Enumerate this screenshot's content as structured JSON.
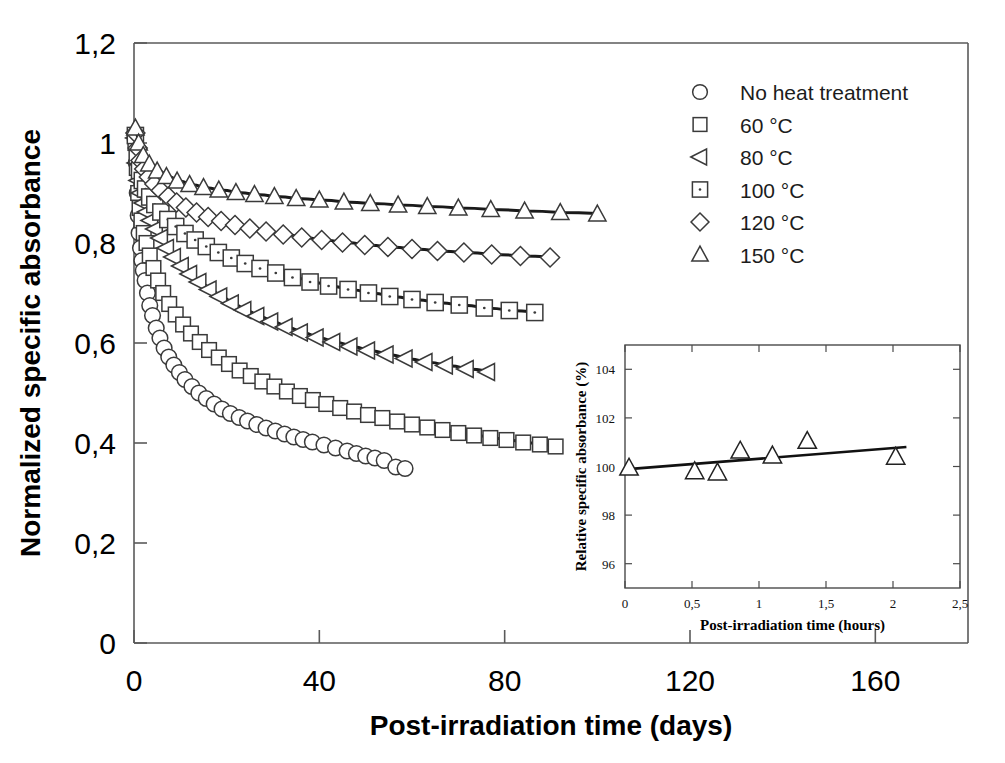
{
  "figure": {
    "background": "#ffffff",
    "ink_color": "#1a1a1a"
  },
  "chart_data": [
    {
      "id": "main",
      "type": "scatter",
      "title": "",
      "xlabel": "Post-irradiation time (days)",
      "ylabel": "Normalized specific absorbance",
      "xlim": [
        0,
        180
      ],
      "ylim": [
        0,
        1.2
      ],
      "xticks": [
        0,
        40,
        80,
        120,
        160
      ],
      "xtick_labels": [
        "0",
        "40",
        "80",
        "120",
        "160"
      ],
      "yticks": [
        0,
        0.2,
        0.4,
        0.6,
        0.8,
        1,
        1.2
      ],
      "ytick_labels": [
        "0",
        "0,2",
        "0,4",
        "0,6",
        "0,8",
        "1",
        "1,2"
      ],
      "grid": false,
      "legend_position": "top-right",
      "series": [
        {
          "name": "No heat treatment",
          "marker": "circle",
          "points": [
            [
              0.3,
              1.005
            ],
            [
              0.5,
              0.96
            ],
            [
              0.7,
              0.9
            ],
            [
              0.9,
              0.855
            ],
            [
              1.1,
              0.82
            ],
            [
              1.4,
              0.79
            ],
            [
              1.7,
              0.765
            ],
            [
              2.0,
              0.745
            ],
            [
              2.4,
              0.725
            ],
            [
              2.9,
              0.7
            ],
            [
              3.4,
              0.675
            ],
            [
              4.0,
              0.655
            ],
            [
              4.8,
              0.63
            ],
            [
              5.6,
              0.61
            ],
            [
              6.5,
              0.59
            ],
            [
              7.5,
              0.572
            ],
            [
              8.6,
              0.556
            ],
            [
              9.8,
              0.541
            ],
            [
              11.0,
              0.527
            ],
            [
              12.5,
              0.513
            ],
            [
              14.0,
              0.5
            ],
            [
              15.6,
              0.489
            ],
            [
              17.3,
              0.478
            ],
            [
              19.0,
              0.468
            ],
            [
              20.8,
              0.459
            ],
            [
              22.7,
              0.451
            ],
            [
              24.5,
              0.444
            ],
            [
              26.5,
              0.437
            ],
            [
              28.5,
              0.43
            ],
            [
              30.5,
              0.424
            ],
            [
              32.5,
              0.418
            ],
            [
              34.5,
              0.412
            ],
            [
              36.5,
              0.407
            ],
            [
              38.5,
              0.402
            ],
            [
              41.0,
              0.396
            ],
            [
              43.5,
              0.39
            ],
            [
              46.0,
              0.384
            ],
            [
              48.0,
              0.379
            ],
            [
              50.0,
              0.374
            ],
            [
              52.0,
              0.37
            ],
            [
              54.0,
              0.365
            ],
            [
              56.5,
              0.352
            ],
            [
              58.5,
              0.349
            ]
          ],
          "fit_from": 0.3,
          "fit_to": 57.0
        },
        {
          "name": "60 °C",
          "marker": "square",
          "points": [
            [
              0.3,
              1.0
            ],
            [
              0.6,
              0.95
            ],
            [
              0.9,
              0.9
            ],
            [
              1.2,
              0.87
            ],
            [
              1.6,
              0.845
            ],
            [
              2.1,
              0.82
            ],
            [
              2.7,
              0.8
            ],
            [
              3.4,
              0.775
            ],
            [
              4.2,
              0.75
            ],
            [
              5.2,
              0.725
            ],
            [
              6.3,
              0.7
            ],
            [
              7.6,
              0.678
            ],
            [
              9.0,
              0.657
            ],
            [
              10.6,
              0.637
            ],
            [
              12.3,
              0.619
            ],
            [
              14.2,
              0.602
            ],
            [
              16.2,
              0.586
            ],
            [
              18.3,
              0.571
            ],
            [
              20.5,
              0.558
            ],
            [
              22.8,
              0.545
            ],
            [
              25.2,
              0.534
            ],
            [
              27.7,
              0.523
            ],
            [
              30.3,
              0.513
            ],
            [
              33.0,
              0.503
            ],
            [
              35.8,
              0.494
            ],
            [
              38.6,
              0.486
            ],
            [
              41.5,
              0.478
            ],
            [
              44.5,
              0.47
            ],
            [
              47.5,
              0.463
            ],
            [
              50.5,
              0.456
            ],
            [
              53.6,
              0.45
            ],
            [
              56.8,
              0.443
            ],
            [
              60.0,
              0.437
            ],
            [
              63.3,
              0.431
            ],
            [
              66.6,
              0.426
            ],
            [
              70.0,
              0.42
            ],
            [
              73.4,
              0.415
            ],
            [
              76.9,
              0.41
            ],
            [
              80.4,
              0.406
            ],
            [
              84.0,
              0.401
            ],
            [
              87.6,
              0.397
            ],
            [
              91.0,
              0.393
            ]
          ],
          "fit_from": 0.3,
          "fit_to": 91.0
        },
        {
          "name": "80 °C",
          "marker": "left-triangle",
          "points": [
            [
              0.3,
              1.01
            ],
            [
              0.6,
              0.96
            ],
            [
              1.0,
              0.925
            ],
            [
              1.5,
              0.9
            ],
            [
              2.1,
              0.88
            ],
            [
              2.8,
              0.862
            ],
            [
              3.6,
              0.845
            ],
            [
              4.6,
              0.828
            ],
            [
              5.7,
              0.81
            ],
            [
              7.0,
              0.79
            ],
            [
              8.5,
              0.772
            ],
            [
              10.2,
              0.754
            ],
            [
              12.0,
              0.738
            ],
            [
              14.0,
              0.722
            ],
            [
              16.2,
              0.707
            ],
            [
              18.5,
              0.693
            ],
            [
              21.0,
              0.679
            ],
            [
              23.7,
              0.666
            ],
            [
              26.5,
              0.654
            ],
            [
              29.5,
              0.643
            ],
            [
              32.6,
              0.632
            ],
            [
              35.9,
              0.621
            ],
            [
              39.3,
              0.611
            ],
            [
              42.9,
              0.602
            ],
            [
              46.6,
              0.593
            ],
            [
              50.4,
              0.585
            ],
            [
              54.4,
              0.577
            ],
            [
              58.5,
              0.569
            ],
            [
              62.8,
              0.562
            ],
            [
              67.2,
              0.555
            ],
            [
              71.7,
              0.548
            ],
            [
              76.3,
              0.542
            ]
          ],
          "fit_from": 0.3,
          "fit_to": 80.0
        },
        {
          "name": "100 °C",
          "marker": "dotted-square",
          "points": [
            [
              0.3,
              1.015
            ],
            [
              0.7,
              0.975
            ],
            [
              1.2,
              0.945
            ],
            [
              1.8,
              0.925
            ],
            [
              2.5,
              0.908
            ],
            [
              3.4,
              0.892
            ],
            [
              4.5,
              0.877
            ],
            [
              5.8,
              0.862
            ],
            [
              7.3,
              0.847
            ],
            [
              9.0,
              0.833
            ],
            [
              11.0,
              0.819
            ],
            [
              13.2,
              0.806
            ],
            [
              15.6,
              0.793
            ],
            [
              18.2,
              0.781
            ],
            [
              21.0,
              0.77
            ],
            [
              24.0,
              0.759
            ],
            [
              27.2,
              0.749
            ],
            [
              30.6,
              0.74
            ],
            [
              34.2,
              0.731
            ],
            [
              38.0,
              0.722
            ],
            [
              42.0,
              0.714
            ],
            [
              46.2,
              0.707
            ],
            [
              50.6,
              0.7
            ],
            [
              55.2,
              0.693
            ],
            [
              60.0,
              0.687
            ],
            [
              65.0,
              0.681
            ],
            [
              70.2,
              0.676
            ],
            [
              75.6,
              0.67
            ],
            [
              81.0,
              0.665
            ],
            [
              86.5,
              0.661
            ]
          ],
          "fit_from": 0.3,
          "fit_to": 88.0
        },
        {
          "name": "120 °C",
          "marker": "diamond",
          "points": [
            [
              0.3,
              1.02
            ],
            [
              0.8,
              0.99
            ],
            [
              1.4,
              0.965
            ],
            [
              2.2,
              0.948
            ],
            [
              3.2,
              0.932
            ],
            [
              4.4,
              0.918
            ],
            [
              5.8,
              0.905
            ],
            [
              7.4,
              0.893
            ],
            [
              9.2,
              0.881
            ],
            [
              11.2,
              0.871
            ],
            [
              13.5,
              0.861
            ],
            [
              16.0,
              0.852
            ],
            [
              18.8,
              0.844
            ],
            [
              21.8,
              0.836
            ],
            [
              25.0,
              0.829
            ],
            [
              28.5,
              0.823
            ],
            [
              32.2,
              0.817
            ],
            [
              36.2,
              0.811
            ],
            [
              40.5,
              0.806
            ],
            [
              45.0,
              0.801
            ],
            [
              49.8,
              0.796
            ],
            [
              54.8,
              0.792
            ],
            [
              60.0,
              0.788
            ],
            [
              65.5,
              0.784
            ],
            [
              71.2,
              0.781
            ],
            [
              77.2,
              0.777
            ],
            [
              83.4,
              0.774
            ],
            [
              89.8,
              0.771
            ]
          ],
          "fit_from": 0.3,
          "fit_to": 92.0
        },
        {
          "name": "150 °C",
          "marker": "triangle",
          "points": [
            [
              0.3,
              1.03
            ],
            [
              1.0,
              1.0
            ],
            [
              2.0,
              0.975
            ],
            [
              3.3,
              0.958
            ],
            [
              5.0,
              0.944
            ],
            [
              7.0,
              0.933
            ],
            [
              9.3,
              0.924
            ],
            [
              12.0,
              0.917
            ],
            [
              15.0,
              0.911
            ],
            [
              18.3,
              0.906
            ],
            [
              22.0,
              0.901
            ],
            [
              26.0,
              0.897
            ],
            [
              30.3,
              0.893
            ],
            [
              35.0,
              0.889
            ],
            [
              40.0,
              0.886
            ],
            [
              45.3,
              0.882
            ],
            [
              51.0,
              0.879
            ],
            [
              57.0,
              0.876
            ],
            [
              63.3,
              0.873
            ],
            [
              70.0,
              0.87
            ],
            [
              77.0,
              0.867
            ],
            [
              84.3,
              0.864
            ],
            [
              92.0,
              0.861
            ],
            [
              100.0,
              0.858
            ]
          ],
          "fit_from": 0.3,
          "fit_to": 102.0
        }
      ]
    },
    {
      "id": "inset",
      "type": "scatter",
      "title": "",
      "xlabel": "Post-irradiation time (hours)",
      "ylabel": "Relative specific absorbance (%)",
      "xlim": [
        0,
        2.5
      ],
      "ylim": [
        95,
        105
      ],
      "xticks": [
        0,
        0.5,
        1,
        1.5,
        2,
        2.5
      ],
      "xtick_labels": [
        "0",
        "0,5",
        "1",
        "1,5",
        "2",
        "2,5"
      ],
      "yticks": [
        96,
        98,
        100,
        102,
        104
      ],
      "ytick_labels": [
        "96",
        "98",
        "100",
        "102",
        "104"
      ],
      "grid": false,
      "marker": "triangle",
      "points": [
        [
          0.03,
          99.95
        ],
        [
          0.52,
          99.8
        ],
        [
          0.69,
          99.75
        ],
        [
          0.86,
          100.65
        ],
        [
          1.1,
          100.45
        ],
        [
          1.36,
          101.05
        ],
        [
          2.02,
          100.4
        ]
      ],
      "trendline": {
        "x": [
          0.0,
          2.1
        ],
        "y": [
          99.88,
          100.8
        ]
      }
    }
  ],
  "legend": {
    "items": [
      {
        "marker": "circle",
        "label": "No heat treatment"
      },
      {
        "marker": "square",
        "label": "60 °C"
      },
      {
        "marker": "left-triangle",
        "label": "80 °C"
      },
      {
        "marker": "dotted-square",
        "label": "100 °C"
      },
      {
        "marker": "diamond",
        "label": "120 °C"
      },
      {
        "marker": "triangle",
        "label": "150 °C"
      }
    ]
  }
}
